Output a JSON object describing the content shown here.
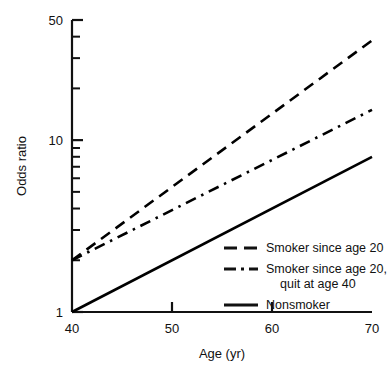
{
  "chart_data": {
    "type": "line",
    "title": "",
    "xlabel": "Age (yr)",
    "ylabel": "Odds ratio",
    "xlim": [
      40,
      70
    ],
    "ylim": [
      1,
      50
    ],
    "yscale": "log",
    "xscale": "linear",
    "grid": false,
    "legend_position": "bottom-right",
    "x_ticks": [
      {
        "value": 40,
        "label": "40",
        "major": true
      },
      {
        "value": 50,
        "label": "50",
        "major": true
      },
      {
        "value": 60,
        "label": "60",
        "major": true
      },
      {
        "value": 70,
        "label": "70",
        "major": true
      }
    ],
    "y_ticks": [
      {
        "value": 1,
        "label": "1",
        "major": true
      },
      {
        "value": 2,
        "label": "",
        "major": false
      },
      {
        "value": 3,
        "label": "",
        "major": false
      },
      {
        "value": 4,
        "label": "",
        "major": false
      },
      {
        "value": 5,
        "label": "",
        "major": false
      },
      {
        "value": 6,
        "label": "",
        "major": false
      },
      {
        "value": 7,
        "label": "",
        "major": false
      },
      {
        "value": 8,
        "label": "",
        "major": false
      },
      {
        "value": 9,
        "label": "",
        "major": false
      },
      {
        "value": 10,
        "label": "10",
        "major": true
      },
      {
        "value": 20,
        "label": "",
        "major": false
      },
      {
        "value": 30,
        "label": "",
        "major": false
      },
      {
        "value": 40,
        "label": "",
        "major": false
      },
      {
        "value": 50,
        "label": "50",
        "major": true
      }
    ],
    "series": [
      {
        "name": "Smoker since age 20",
        "style": "dashed",
        "color": "#000000",
        "x": [
          40,
          70
        ],
        "values": [
          2.0,
          38.0
        ]
      },
      {
        "name": "Smoker since age 20, quit at age 40",
        "style": "dash-dot",
        "color": "#000000",
        "x": [
          40,
          70
        ],
        "values": [
          2.0,
          15.0
        ]
      },
      {
        "name": "Nonsmoker",
        "style": "solid",
        "color": "#000000",
        "x": [
          40,
          70
        ],
        "values": [
          1.0,
          8.0
        ]
      }
    ]
  },
  "legend": {
    "entries": [
      {
        "label": "Smoker since age 20",
        "label2": "",
        "style": "dashed"
      },
      {
        "label": "Smoker since age 20,",
        "label2": "quit at age 40",
        "style": "dash-dot"
      },
      {
        "label": "Nonsmoker",
        "label2": "",
        "style": "solid"
      }
    ]
  },
  "axes": {
    "x_title": "Age (yr)",
    "y_title": "Odds ratio"
  },
  "colors": {
    "ink": "#111111",
    "background": "#ffffff"
  }
}
